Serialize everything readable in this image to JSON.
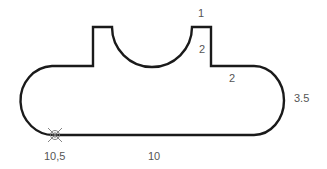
{
  "diagram": {
    "type": "profile-outline",
    "stroke_color": "#1a1a1a",
    "label_color": "#555555",
    "marker_color": "#777777",
    "labels": [
      {
        "id": "post-top-width",
        "text": "1",
        "x": 198,
        "y": 17
      },
      {
        "id": "post-height",
        "text": "2",
        "x": 201,
        "y": 52
      },
      {
        "id": "shoulder-length",
        "text": "2",
        "x": 231,
        "y": 80
      },
      {
        "id": "end-radius",
        "text": "3.5",
        "x": 294,
        "y": 101
      },
      {
        "id": "start-point",
        "text": "10,5",
        "x": 44,
        "y": 159
      },
      {
        "id": "bottom-length",
        "text": "10",
        "x": 150,
        "y": 159
      }
    ],
    "start_marker": {
      "label": "start-point-marker",
      "x": 55,
      "y": 135
    }
  }
}
